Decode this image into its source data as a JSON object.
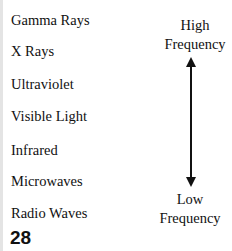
{
  "spectrum": {
    "bands": [
      "Gamma Rays",
      "X Rays",
      "Ultraviolet",
      "Visible Light",
      "Infrared",
      "Microwaves",
      "Radio Waves"
    ],
    "high_label_line1": "High",
    "high_label_line2": "Frequency",
    "low_label_line1": "Low",
    "low_label_line2": "Frequency",
    "arrow_icon": "double-headed-vertical-arrow"
  },
  "page_number": "28"
}
